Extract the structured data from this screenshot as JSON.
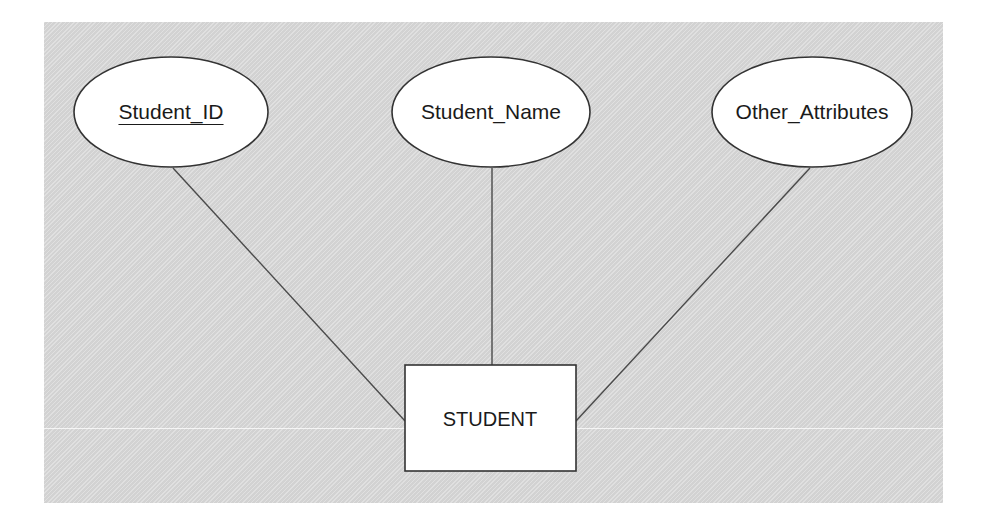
{
  "diagram": {
    "type": "entity-relationship",
    "entity": {
      "name": "STUDENT",
      "shape": "rectangle"
    },
    "attributes": [
      {
        "label": "Student_ID",
        "key": true,
        "shape": "ellipse"
      },
      {
        "label": "Student_Name",
        "key": false,
        "shape": "ellipse"
      },
      {
        "label": "Other_Attributes",
        "key": false,
        "shape": "ellipse"
      }
    ],
    "colors": {
      "background": "#d9d9d9",
      "shape_fill": "#ffffff",
      "stroke": "#333333",
      "connector": "#4a4a4a",
      "text": "#1a1a1a"
    }
  }
}
